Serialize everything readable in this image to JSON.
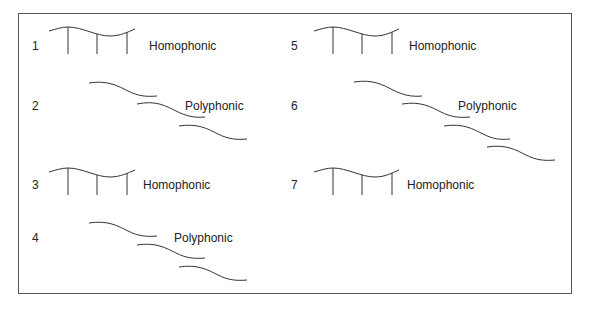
{
  "diagram": {
    "type": "texture-comparison",
    "items": [
      {
        "number": "1",
        "label": "Homophonic",
        "texture": "homophonic"
      },
      {
        "number": "2",
        "label": "Polyphonic",
        "texture": "polyphonic",
        "voices": 3
      },
      {
        "number": "3",
        "label": "Homophonic",
        "texture": "homophonic"
      },
      {
        "number": "4",
        "label": "Polyphonic",
        "texture": "polyphonic",
        "voices": 3
      },
      {
        "number": "5",
        "label": "Homophonic",
        "texture": "homophonic"
      },
      {
        "number": "6",
        "label": "Polyphonic",
        "texture": "polyphonic",
        "voices": 4
      },
      {
        "number": "7",
        "label": "Homophonic",
        "texture": "homophonic"
      }
    ],
    "colors": {
      "stroke": "#333333",
      "text": "#222222",
      "frame": "#555555",
      "background": "#ffffff"
    }
  }
}
